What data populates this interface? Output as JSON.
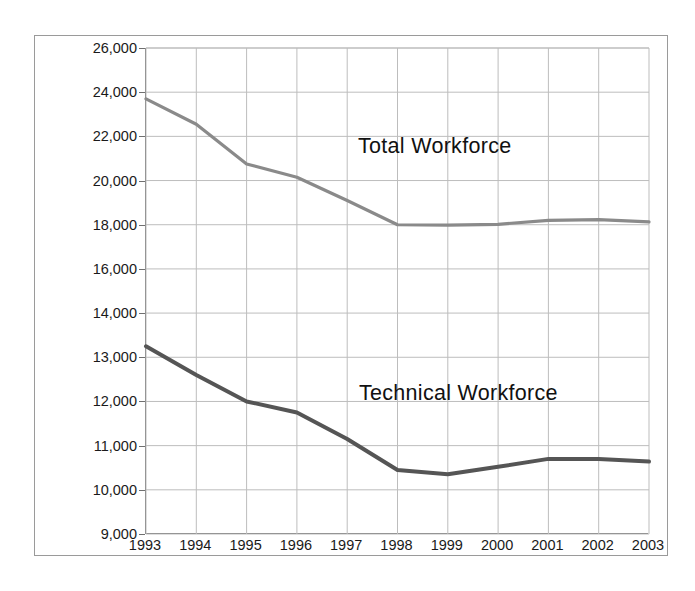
{
  "chart_data": {
    "type": "line",
    "title": "",
    "xlabel": "",
    "ylabel": "Full Time Persons Employment",
    "x": [
      1993,
      1994,
      1995,
      1996,
      1997,
      1998,
      1999,
      2000,
      2001,
      2002,
      2003
    ],
    "x_tick_labels": [
      "1993",
      "1994",
      "1995",
      "1996",
      "1997",
      "1998",
      "1999",
      "2000",
      "2001",
      "2002",
      "2003"
    ],
    "y_tick_labels": [
      "26,000",
      "24,000",
      "22,000",
      "20,000",
      "18,000",
      "16,000",
      "14,000",
      "13,000",
      "12,000",
      "11,000",
      "10,000",
      "9,000"
    ],
    "y_tick_values": [
      26000,
      24000,
      22000,
      20000,
      18000,
      16000,
      14000,
      13000,
      12000,
      11000,
      10000,
      9000
    ],
    "y_axis_note": "Non-linear axis: evenly spaced ticks step by 2,000 from 26,000 down to 14,000, then by 1,000 from 13,000 down to 9,000",
    "ylim": [
      9000,
      26000
    ],
    "grid": true,
    "legend_position": "inline-annotations",
    "series": [
      {
        "name": "Total Workforce",
        "color": "#8a8a8a",
        "values": [
          23700,
          22550,
          20750,
          20150,
          19100,
          18000,
          17980,
          18020,
          18200,
          18230,
          18130
        ]
      },
      {
        "name": "Technical Workforce",
        "color": "#555555",
        "values": [
          13250,
          12600,
          12000,
          11750,
          11150,
          10450,
          10350,
          10520,
          10700,
          10700,
          10640
        ]
      }
    ],
    "annotations": [
      {
        "text": "Total Workforce",
        "series": "Total Workforce"
      },
      {
        "text": "Technical Workforce",
        "series": "Technical Workforce"
      }
    ]
  },
  "axis": {
    "y_title": "Full Time Persons Employment"
  },
  "style": {
    "grid_color": "#bdbdbd",
    "axis_color": "#6f6f6f",
    "frame_color": "#9a9a9a",
    "text_color": "#1a1a1a",
    "background": "#ffffff"
  }
}
